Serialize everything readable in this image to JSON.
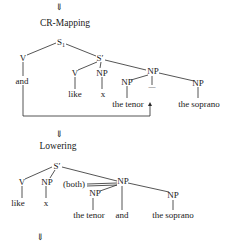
{
  "diagram": {
    "type": "syntax-tree-derivation",
    "steps": [
      {
        "arrow": "⇓",
        "rule": "CR-Mapping",
        "nodes": {
          "root": "S",
          "root_sub": "1",
          "v": "V",
          "and": "and",
          "sprime": "S′",
          "v2": "V",
          "np_x": "NP",
          "like": "like",
          "x": "x",
          "np_mid": "NP",
          "np_tenor": "NP",
          "gap": "—",
          "np_soprano": "NP",
          "the_tenor": "the tenor",
          "the_soprano": "the soprano"
        }
      },
      {
        "arrow": "⇓",
        "rule": "Lowering",
        "nodes": {
          "sprime": "S′",
          "v": "V",
          "np_x": "NP",
          "like": "like",
          "x": "x",
          "both": "(both)",
          "np_mid": "NP",
          "np_tenor": "NP",
          "the_tenor": "the tenor",
          "and": "and",
          "np_soprano": "NP",
          "the_soprano": "the soprano"
        }
      }
    ],
    "final_arrow": "⇓"
  }
}
